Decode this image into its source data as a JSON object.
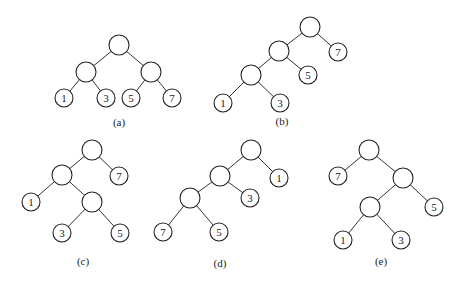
{
  "figure": {
    "trees": [
      {
        "id": "a",
        "caption": "(a)",
        "structure": "((1,3),(5,7))",
        "leaves": [
          "1",
          "3",
          "5",
          "7"
        ]
      },
      {
        "id": "b",
        "caption": "(b)",
        "structure": "(((1,3),5),7)",
        "leaves": [
          "1",
          "3",
          "5",
          "7"
        ]
      },
      {
        "id": "c",
        "caption": "(c)",
        "structure": "((1,(3,5)),7)",
        "leaves": [
          "1",
          "3",
          "5",
          "7"
        ]
      },
      {
        "id": "d",
        "caption": "(d)",
        "structure": "(((7,5),3),1)",
        "leaves": [
          "7",
          "5",
          "3",
          "1"
        ]
      },
      {
        "id": "e",
        "caption": "(e)",
        "structure": "(7,((1,3),5))",
        "leaves": [
          "7",
          "1",
          "3",
          "5"
        ]
      }
    ]
  }
}
